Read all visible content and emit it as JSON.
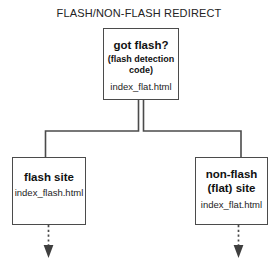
{
  "title": "FLASH/NON-FLASH REDIRECT",
  "colors": {
    "background": "#ffffff",
    "box_border": "#4b4b4b",
    "connector": "#4b4b4b",
    "text": "#1a1a1a"
  },
  "nodes": {
    "root": {
      "heading": "got flash?",
      "sub_line_1": "(flash detection",
      "sub_line_2": "code)",
      "file": "index_flat.html"
    },
    "flash": {
      "heading": "flash site",
      "file": "index_flash.html"
    },
    "nonflash": {
      "heading_line_1": "non-flash",
      "heading_line_2": "(flat) site",
      "file": "index_flat.html"
    }
  },
  "connectors": {
    "left_branch": "solid-elbow",
    "right_branch": "solid-elbow",
    "flash_exit": "dotted-arrow-down",
    "nonflash_exit": "dotted-arrow-down"
  }
}
